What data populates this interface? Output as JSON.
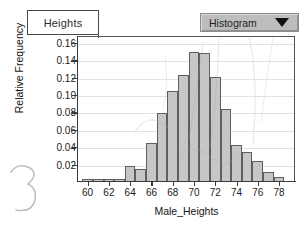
{
  "window": {
    "tab_label": "Heights",
    "dropdown_value": "Histogram",
    "dropdown_icon": "triangle-down-icon"
  },
  "chart_data": {
    "type": "bar",
    "title": "",
    "subtitle": "",
    "xlabel": "Male_Heights",
    "ylabel": "Relative Frequency",
    "xlim": [
      59,
      79.5
    ],
    "ylim": [
      0,
      0.168
    ],
    "grid": true,
    "legend": false,
    "legend_position": "none",
    "bar_fill_color": "#c6c6c6",
    "bar_border_color": "#5e5e5e",
    "xticks": [
      60,
      62,
      64,
      66,
      68,
      70,
      72,
      74,
      76,
      78
    ],
    "xtick_labels": [
      "60",
      "62",
      "64",
      "66",
      "68",
      "70",
      "72",
      "74",
      "76",
      "78"
    ],
    "yticks": [
      0.02,
      0.04,
      0.06,
      0.08,
      0.1,
      0.12,
      0.14,
      0.16
    ],
    "ytick_labels": [
      "0.02",
      "0.04",
      "0.06",
      "0.08",
      "0.10",
      "0.12",
      "0.14",
      "0.16"
    ],
    "bin_width": 1,
    "categories": [
      60,
      61,
      62,
      63,
      64,
      65,
      66,
      67,
      68,
      69,
      70,
      71,
      72,
      73,
      74,
      75,
      76,
      77,
      78
    ],
    "values": [
      0.003,
      0.003,
      0.003,
      0.003,
      0.019,
      0.015,
      0.045,
      0.079,
      0.105,
      0.123,
      0.15,
      0.148,
      0.121,
      0.084,
      0.043,
      0.035,
      0.024,
      0.011,
      0.006
    ]
  }
}
